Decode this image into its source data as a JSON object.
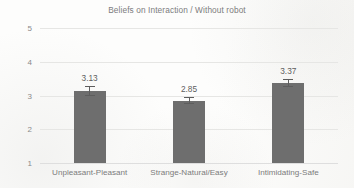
{
  "chart_data": {
    "type": "bar",
    "title": "Beliefs on Interaction / Without robot",
    "xlabel": "",
    "ylabel": "",
    "categories": [
      "Unpleasant-Pleasant",
      "Strange-Natural/Easy",
      "Intimidating-Safe"
    ],
    "values": [
      3.13,
      2.85,
      3.37
    ],
    "value_labels": [
      "3.13",
      "2.85",
      "3.37"
    ],
    "errors": [
      0.15,
      0.11,
      0.12
    ],
    "ylim": [
      1,
      5
    ],
    "yticks": [
      1,
      2,
      3,
      4,
      5
    ],
    "ytick_labels": [
      "1",
      "2",
      "3",
      "4",
      "5"
    ],
    "grid": true,
    "legend": false,
    "bar_color": "#6e6e6e",
    "errorbar_color": "#5d5d5d",
    "gridline_color": "#e6e6e4",
    "text_color": "#7c7c7c",
    "background_color": "#fdfdfc"
  }
}
